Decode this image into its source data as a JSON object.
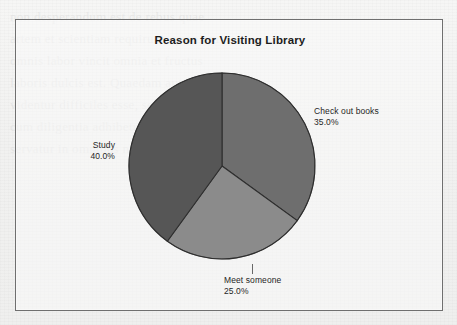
{
  "page": {
    "background_color": "#f1f1f0",
    "scan_ghost_text": "non desperandum est de rebus quae\nartem et scientiam requirunt, quoniam\nomnis labor vincit omnia et fructus\nlaboris dulcis est. Quaedam autem res\nvidentur difficiles esse, sed facile fiunt\ncum diligentia adhibetur et ratio recta\nservatur in omnibus negotiis nostris."
  },
  "chart_frame": {
    "border_color": "#6f6f6f",
    "fill_color": "#fafaf9"
  },
  "chart_data": {
    "type": "pie",
    "title": "Reason for Visiting Library",
    "xlabel": "",
    "ylabel": "",
    "legend": "none",
    "start_angle_deg": 0,
    "direction": "clockwise",
    "categories": [
      "Check out books",
      "Meet someone",
      "Study"
    ],
    "values": [
      35.0,
      25.0,
      40.0
    ],
    "value_labels": [
      "35.0%",
      "25.0%",
      "40.0%"
    ],
    "colors": [
      "#6e6e6e",
      "#8b8b8b",
      "#565656"
    ],
    "slice_border_color": "#2f2f2f",
    "slices": [
      {
        "label": "Check out books",
        "value": 35.0,
        "value_label": "35.0%",
        "color": "#6e6e6e",
        "start_angle_deg": 0,
        "end_angle_deg": 126,
        "label_position": "right"
      },
      {
        "label": "Meet someone",
        "value": 25.0,
        "value_label": "25.0%",
        "color": "#8b8b8b",
        "start_angle_deg": 126,
        "end_angle_deg": 216,
        "label_position": "bottom"
      },
      {
        "label": "Study",
        "value": 40.0,
        "value_label": "40.0%",
        "color": "#565656",
        "start_angle_deg": 216,
        "end_angle_deg": 360,
        "label_position": "left"
      }
    ]
  }
}
